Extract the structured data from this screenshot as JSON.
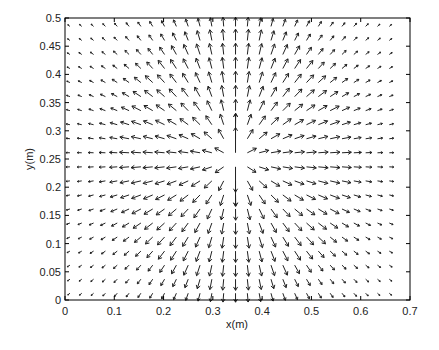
{
  "chart_data": {
    "type": "quiver",
    "title": "",
    "xlabel": "x(m)",
    "ylabel": "y(m)",
    "xlim": [
      0,
      0.7
    ],
    "ylim": [
      0,
      0.5
    ],
    "xticks": [
      0,
      0.1,
      0.2,
      0.3,
      0.4,
      0.5,
      0.6,
      0.7
    ],
    "xtick_labels": [
      "0",
      "0.1",
      "0.2",
      "0.3",
      "0.4",
      "0.5",
      "0.6",
      "0.7"
    ],
    "yticks": [
      0,
      0.05,
      0.1,
      0.15,
      0.2,
      0.25,
      0.3,
      0.35,
      0.4,
      0.45,
      0.5
    ],
    "ytick_labels": [
      "0",
      "0.05",
      "0.1",
      "0.15",
      "0.2",
      "0.25",
      "0.3",
      "0.35",
      "0.4",
      "0.45",
      "0.5"
    ],
    "grid": false,
    "legend": null,
    "field": {
      "description": "Vector field radiating outward from a center, strongest near the center",
      "center": [
        0.345,
        0.25
      ],
      "x_start": 0.01,
      "x_step": 0.024,
      "x_count": 28,
      "y_start": 0.012,
      "y_step": 0.0249,
      "y_count": 20,
      "peak_vectors": [
        {
          "x": 0.345,
          "y": 0.275,
          "u": 0.0,
          "v": 0.045
        },
        {
          "x": 0.345,
          "y": 0.225,
          "u": 0.0,
          "v": -0.045
        }
      ]
    }
  },
  "axes_frame": {
    "left": 65,
    "top": 18,
    "right": 410,
    "bottom": 300
  }
}
